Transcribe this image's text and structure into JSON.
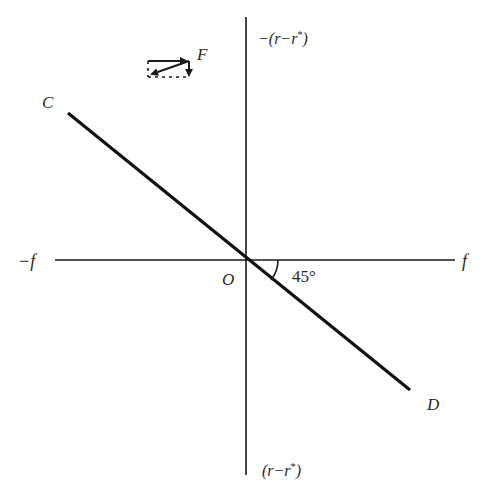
{
  "diagram": {
    "type": "coordinate-axes-with-line",
    "colors": {
      "ink": "#1a1a1a",
      "label": "#2a2a2a",
      "background": "#ffffff"
    },
    "axes": {
      "horizontal": {
        "negative_label": "−f",
        "positive_label": "f"
      },
      "vertical": {
        "top_label": "−(r−r",
        "top_label_sup": "*",
        "top_label_close": ")",
        "bottom_label": "(r−r",
        "bottom_label_sup": "*",
        "bottom_label_close": ")"
      },
      "origin_label": "O"
    },
    "line": {
      "start_label": "C",
      "end_label": "D",
      "angle_label": "45°"
    },
    "force_inset": {
      "label": "F",
      "description": "force vector F decomposed into horizontal and vertical components (dashed parallelogram)"
    }
  }
}
